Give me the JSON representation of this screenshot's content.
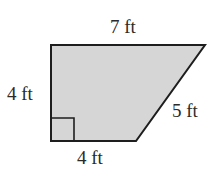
{
  "figure": {
    "shape": "right trapezoid",
    "labels": {
      "top": "7 ft",
      "left": "4 ft",
      "slant": "5 ft",
      "bottom": "4 ft"
    },
    "colors": {
      "fill": "#d6d6d6",
      "stroke": "#1e1e1e",
      "text": "#2a2a2a"
    },
    "right_angle_marker": true
  }
}
